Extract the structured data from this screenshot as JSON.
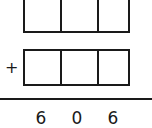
{
  "problem": {
    "type": "vertical-addition",
    "operator": "+",
    "addend_top": {
      "cells": [
        "",
        "",
        ""
      ]
    },
    "addend_bottom": {
      "cells": [
        "",
        "",
        ""
      ]
    },
    "sum": {
      "digits": [
        "6",
        "0",
        "6"
      ]
    }
  },
  "colors": {
    "ink": "#1a1a1a",
    "background": "#ffffff"
  }
}
